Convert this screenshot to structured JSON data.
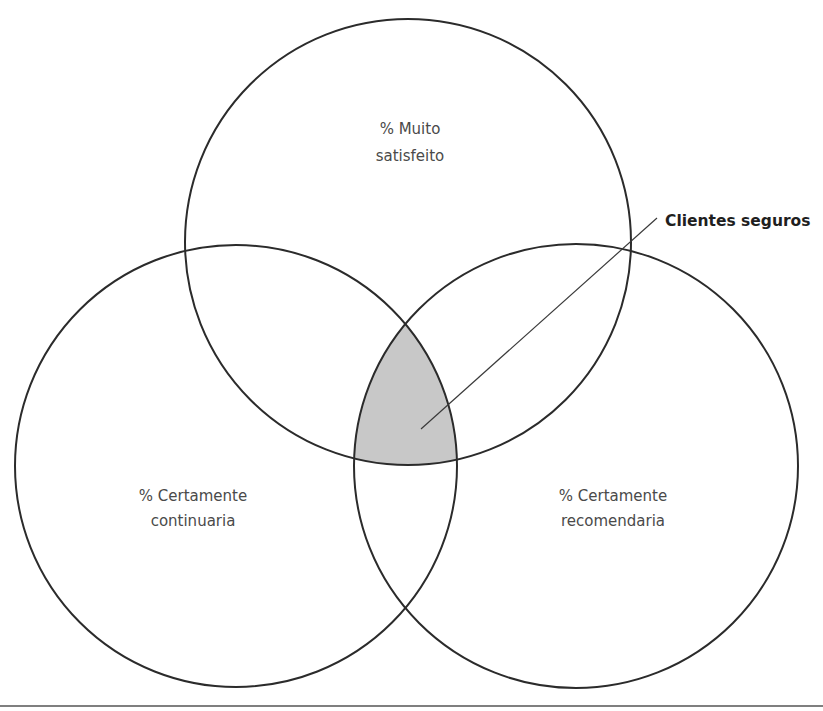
{
  "diagram": {
    "type": "venn-3",
    "circles": [
      {
        "id": "top",
        "label_lines": [
          "% Muito",
          "satisfeito"
        ],
        "cx": 408,
        "cy": 242,
        "r": 223
      },
      {
        "id": "left",
        "label_lines": [
          "% Certamente",
          "continuaria"
        ],
        "cx": 236,
        "cy": 466,
        "r": 221
      },
      {
        "id": "right",
        "label_lines": [
          "% Certamente",
          "recomendaria"
        ],
        "cx": 576,
        "cy": 466,
        "r": 222
      }
    ],
    "highlight": {
      "region": "intersection-all-three",
      "fill": "#c8c8c8"
    },
    "callout": {
      "label": "Clientes seguros",
      "points_to": "intersection-all-three"
    },
    "colors": {
      "stroke": "#2b2b2b",
      "shade": "#c8c8c8",
      "text": "#4a4a4a"
    }
  }
}
